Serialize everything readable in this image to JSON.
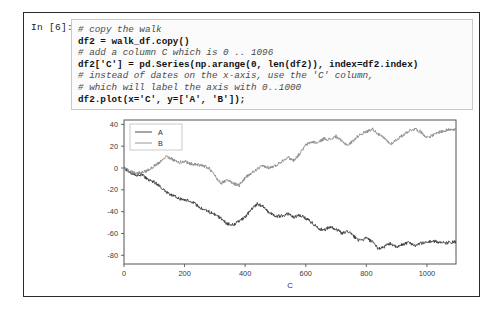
{
  "cell": {
    "prompt": "In [6]:",
    "code_lines": [
      {
        "text": "# copy the walk",
        "kind": "comment"
      },
      {
        "text": "df2 = walk_df.copy()",
        "kind": "stmt"
      },
      {
        "text": "# add a column C which is 0 .. 1096",
        "kind": "comment"
      },
      {
        "text": "df2['C'] = pd.Series(np.arange(0, len(df2)), index=df2.index)",
        "kind": "stmt"
      },
      {
        "text": "# instead of dates on the x-axis, use the 'C' column,",
        "kind": "comment"
      },
      {
        "text": "# which will label the axis with 0..1000",
        "kind": "comment"
      },
      {
        "text": "df2.plot(x='C', y=['A', 'B']);",
        "kind": "stmt"
      }
    ]
  },
  "chart_data": {
    "type": "line",
    "title": "",
    "xlabel": "C",
    "ylabel": "",
    "xlim": [
      0,
      1096
    ],
    "ylim": [
      -88,
      44
    ],
    "xticks": [
      0,
      200,
      400,
      600,
      800,
      1000
    ],
    "xtick_labels": [
      "0",
      "200",
      "400",
      "600",
      "800",
      "1000"
    ],
    "yticks": [
      40,
      20,
      0,
      -20,
      -40,
      -60,
      -80
    ],
    "ytick_labels": [
      "40",
      "20",
      "0",
      "-20",
      "-40",
      "-60",
      "-80"
    ],
    "grid": false,
    "legend_position": "upper left",
    "legend_entries": [
      "A",
      "B"
    ],
    "colors": {
      "A": "#3b3b3b",
      "B": "#8a8a8a"
    },
    "series": [
      {
        "name": "A",
        "x": [
          0,
          20,
          40,
          60,
          80,
          100,
          120,
          140,
          160,
          180,
          200,
          220,
          240,
          260,
          280,
          300,
          320,
          340,
          360,
          380,
          400,
          420,
          440,
          460,
          480,
          500,
          520,
          540,
          560,
          580,
          600,
          620,
          640,
          660,
          680,
          700,
          720,
          740,
          760,
          780,
          800,
          820,
          840,
          860,
          880,
          900,
          920,
          940,
          960,
          980,
          1000,
          1020,
          1040,
          1060,
          1080,
          1096
        ],
        "values": [
          0,
          -4,
          -7,
          -6,
          -11,
          -13,
          -17,
          -22,
          -25,
          -28,
          -29,
          -30,
          -34,
          -38,
          -40,
          -43,
          -46,
          -51,
          -52,
          -49,
          -45,
          -38,
          -33,
          -35,
          -41,
          -44,
          -44,
          -42,
          -45,
          -43,
          -46,
          -50,
          -55,
          -57,
          -54,
          -56,
          -60,
          -58,
          -63,
          -67,
          -64,
          -68,
          -74,
          -72,
          -69,
          -73,
          -70,
          -68,
          -71,
          -69,
          -68,
          -67,
          -68,
          -69,
          -68,
          -68
        ]
      },
      {
        "name": "B",
        "x": [
          0,
          20,
          40,
          60,
          80,
          100,
          120,
          140,
          160,
          180,
          200,
          220,
          240,
          260,
          280,
          300,
          320,
          340,
          360,
          380,
          400,
          420,
          440,
          460,
          480,
          500,
          520,
          540,
          560,
          580,
          600,
          620,
          640,
          660,
          680,
          700,
          720,
          740,
          760,
          780,
          800,
          820,
          840,
          860,
          880,
          900,
          920,
          940,
          960,
          980,
          1000,
          1020,
          1040,
          1060,
          1080,
          1096
        ],
        "values": [
          0,
          -3,
          -5,
          -4,
          -2,
          2,
          6,
          11,
          8,
          5,
          6,
          4,
          3,
          2,
          0,
          -7,
          -14,
          -11,
          -14,
          -16,
          -9,
          -5,
          -1,
          2,
          0,
          2,
          6,
          10,
          7,
          13,
          21,
          24,
          23,
          27,
          26,
          29,
          24,
          21,
          26,
          31,
          33,
          36,
          31,
          27,
          22,
          26,
          30,
          34,
          36,
          33,
          28,
          30,
          33,
          34,
          36,
          35
        ]
      }
    ]
  }
}
